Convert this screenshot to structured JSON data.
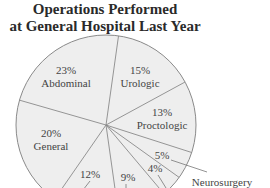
{
  "chart_data": {
    "type": "pie",
    "title": "Operations Performed at General Hospital Last Year",
    "title_lines": [
      "Operations Performed",
      "at General Hospital Last Year"
    ],
    "slices": [
      {
        "label": "Urologic",
        "value": 15,
        "pct_text": "15%"
      },
      {
        "label": "Proctologic",
        "value": 13,
        "pct_text": "13%"
      },
      {
        "label": "",
        "value": 5,
        "pct_text": "5%"
      },
      {
        "label": "Neurosurgery",
        "value": 4,
        "pct_text": "4%"
      },
      {
        "label": "",
        "value": 9,
        "pct_text": "9%"
      },
      {
        "label": "",
        "value": 12,
        "pct_text": "12%"
      },
      {
        "label": "General",
        "value": 20,
        "pct_text": "20%"
      },
      {
        "label": "Abdominal",
        "value": 23,
        "pct_text": "23%"
      }
    ],
    "colors": {
      "fill": "#eeeeee",
      "stroke": "#8a8a8a",
      "text": "#444444"
    },
    "legend": "none"
  }
}
